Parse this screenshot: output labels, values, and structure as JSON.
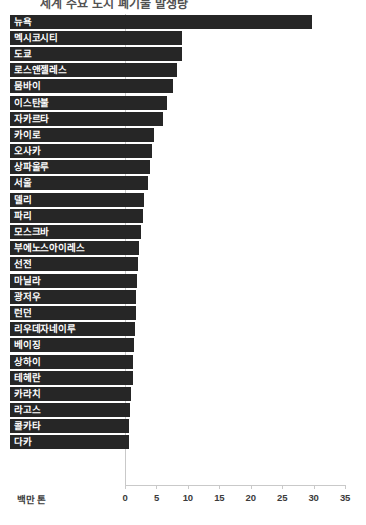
{
  "title": "세계 주요 도시 폐기물 발생량",
  "axis_unit_label": "백만 톤",
  "colors": {
    "bar": "#262626",
    "axis": "#c9c9c9",
    "label_text": "#ffffff",
    "tick_text": "#3b3b3b",
    "background": "#ffffff"
  },
  "chart_data": {
    "type": "bar",
    "orientation": "horizontal",
    "title": "세계 주요 도시 폐기물 발생량",
    "xlabel": "백만 톤",
    "ylabel": "",
    "xlim": [
      0,
      35
    ],
    "xticks": [
      0,
      5,
      10,
      15,
      20,
      25,
      30,
      35
    ],
    "xtick_labels": [
      "0",
      "5",
      "10",
      "15",
      "20",
      "25",
      "30",
      "35"
    ],
    "grid": false,
    "legend": false,
    "categories": [
      "뉴욕",
      "멕시코시티",
      "도쿄",
      "로스앤젤레스",
      "뭄바이",
      "이스탄불",
      "자카르타",
      "카이로",
      "오사카",
      "상파울루",
      "서울",
      "델리",
      "파리",
      "모스크바",
      "부에노스아이레스",
      "선전",
      "마닐라",
      "광저우",
      "런던",
      "리우데자네이루",
      "베이징",
      "상하이",
      "테헤란",
      "카라치",
      "라고스",
      "콜카타",
      "다카"
    ],
    "values": [
      29.7,
      9.1,
      9.0,
      8.3,
      7.6,
      6.7,
      6.1,
      4.6,
      4.3,
      4.0,
      3.6,
      3.1,
      2.8,
      2.6,
      2.3,
      2.1,
      1.9,
      1.8,
      1.7,
      1.6,
      1.4,
      1.3,
      1.2,
      1.0,
      0.8,
      0.7,
      0.6
    ]
  }
}
